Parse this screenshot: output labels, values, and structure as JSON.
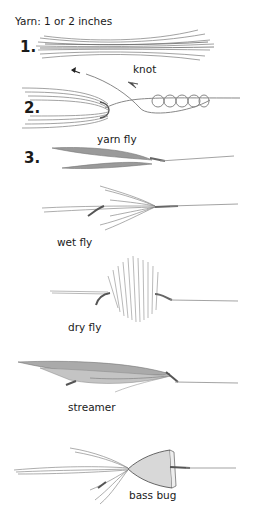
{
  "header": {
    "caption": "Yarn: 1 or 2 inches"
  },
  "steps": [
    {
      "number": "1.",
      "description": "yarn bundle"
    },
    {
      "number": "2.",
      "description": "tie yarn with knot",
      "annotation": "knot"
    },
    {
      "number": "3.",
      "description": "finished flies"
    }
  ],
  "flies": [
    {
      "label": "yarn fly"
    },
    {
      "label": "wet fly"
    },
    {
      "label": "dry fly"
    },
    {
      "label": "streamer"
    },
    {
      "label": "bass bug"
    }
  ],
  "colors": {
    "ink": "#1a1a1a",
    "yarn": "#8a8a8a",
    "line": "#9a9a9a",
    "cork": "#d8d8d8"
  }
}
